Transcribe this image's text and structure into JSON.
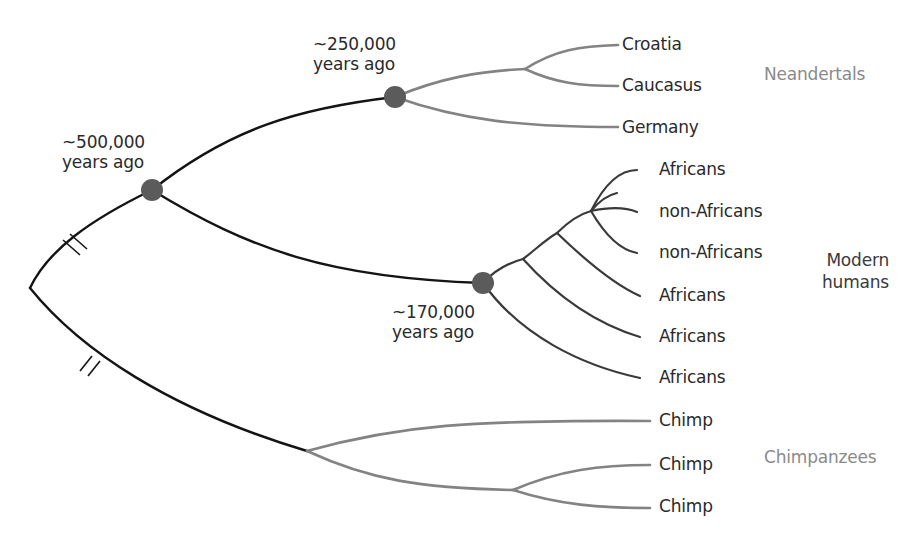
{
  "diagram": {
    "type": "phylogenetic-tree",
    "colors": {
      "ancestral_branch": "#141414",
      "human_branch": "#3a3a3a",
      "neandertal_branch": "#838383",
      "chimp_branch": "#838383",
      "node_dot": "#5b5b5b",
      "group_label_grey": "#8a8a8a",
      "group_label_dark": "#3a3a3a"
    },
    "time_labels": {
      "node_500k": {
        "line1": "~500,000",
        "line2": "years ago"
      },
      "node_250k": {
        "line1": "~250,000",
        "line2": "years ago"
      },
      "node_170k": {
        "line1": "~170,000",
        "line2": "years ago"
      }
    },
    "groups": {
      "neandertals": {
        "label": "Neandertals",
        "leaves": [
          "Croatia",
          "Caucasus",
          "Germany"
        ]
      },
      "modern_humans": {
        "label_line1": "Modern",
        "label_line2": "humans",
        "leaves": [
          "Africans",
          "non-Africans",
          "non-Africans",
          "Africans",
          "Africans",
          "Africans"
        ]
      },
      "chimpanzees": {
        "label": "Chimpanzees",
        "leaves": [
          "Chimp",
          "Chimp",
          "Chimp"
        ]
      }
    },
    "break_marks": 2
  }
}
